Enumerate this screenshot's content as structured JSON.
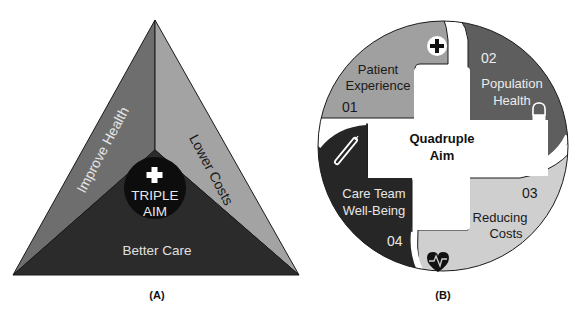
{
  "panel_a": {
    "caption": "(A)",
    "center_title_line1": "TRIPLE",
    "center_title_line2": "AIM",
    "center_icon": "plus-icon",
    "segments": [
      {
        "label": "Improve Health",
        "color": "#6e6e6e"
      },
      {
        "label": "Lower Costs",
        "color": "#a3a3a3"
      },
      {
        "label": "Better Care",
        "color": "#2b2b2b"
      }
    ],
    "center_color": "#0d0d0d"
  },
  "panel_b": {
    "caption": "(B)",
    "center_title_line1": "Quadruple",
    "center_title_line2": "Aim",
    "segments": [
      {
        "number": "01",
        "line1": "Patient",
        "line2": "Experience",
        "icon": "medical-cross-icon",
        "color": "#a0a0a0"
      },
      {
        "number": "02",
        "line1": "Population",
        "line2": "Health",
        "icon": "pill-capsule-icon",
        "color": "#5e5e5e"
      },
      {
        "number": "03",
        "line1": "Reducing",
        "line2": "Costs",
        "icon": "heart-pulse-icon",
        "color": "#cfcfcf"
      },
      {
        "number": "04",
        "line1": "Care Team",
        "line2": "Well-Being",
        "icon": "thermometer-icon",
        "color": "#262626"
      }
    ]
  }
}
